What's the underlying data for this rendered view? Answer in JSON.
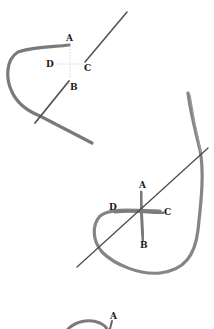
{
  "diagrams": [
    {
      "step": 1,
      "labels": {
        "A": "A",
        "B": "B",
        "C": "C",
        "D": "D"
      }
    },
    {
      "step": 2,
      "labels": {
        "A": "A",
        "B": "B",
        "C": "C",
        "D": "D"
      }
    },
    {
      "step": 3,
      "labels": {
        "A": "A"
      }
    }
  ],
  "colors": {
    "thread": "#7a7a7a",
    "needle": "#555555",
    "guide": "#c8c8c8",
    "label": "#1a1a1a",
    "background": "#ffffff"
  }
}
